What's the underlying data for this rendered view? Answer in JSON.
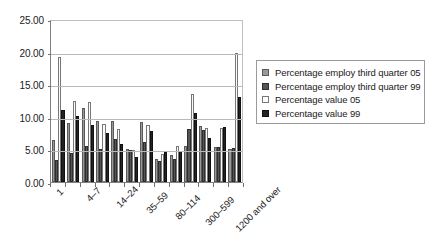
{
  "chart_data": {
    "type": "bar",
    "title": "",
    "xlabel": "",
    "ylabel": "",
    "ylim": [
      0,
      25
    ],
    "ytick_labels": [
      "0.00",
      "5.00",
      "10.00",
      "15.00",
      "20.00",
      "25.00"
    ],
    "ytick_values": [
      0,
      5,
      10,
      15,
      20,
      25
    ],
    "grid": true,
    "legend_position": "right",
    "categories": [
      "1",
      "2-3",
      "4-7",
      "8-13",
      "14-24",
      "25-34",
      "35-59",
      "60-79",
      "80-114",
      "115-299",
      "300-599",
      "600-1199",
      "1200 and over"
    ],
    "visible_tick_labels": [
      {
        "index": 0,
        "text": "1"
      },
      {
        "index": 2,
        "text": "4–7"
      },
      {
        "index": 4,
        "text": "14–24"
      },
      {
        "index": 6,
        "text": "35–59"
      },
      {
        "index": 8,
        "text": "80–114"
      },
      {
        "index": 10,
        "text": "300–599"
      },
      {
        "index": 12,
        "text": "1200 and over"
      }
    ],
    "series": [
      {
        "name": "Percentage employ third quarter 05",
        "color": "#999999",
        "values": [
          6.5,
          9.1,
          11.3,
          9.3,
          9.3,
          5.0,
          9.2,
          3.5,
          4.2,
          5.6,
          8.6,
          5.4,
          5.1
        ]
      },
      {
        "name": "Percentage employ third quarter 99",
        "color": "#555555",
        "values": [
          3.3,
          4.4,
          5.6,
          5.0,
          6.6,
          4.9,
          6.1,
          3.2,
          3.5,
          8.1,
          8.0,
          5.4,
          5.2
        ]
      },
      {
        "name": "Percentage value 05",
        "color": "#fdfdfd",
        "values": [
          19.1,
          12.5,
          12.3,
          8.9,
          8.1,
          4.9,
          8.8,
          4.3,
          5.6,
          13.5,
          8.3,
          8.3,
          19.8
        ]
      },
      {
        "name": "Percentage value 99",
        "color": "#232323",
        "values": [
          11.1,
          10.2,
          8.7,
          7.5,
          5.9,
          3.8,
          7.9,
          4.6,
          4.8,
          10.6,
          6.7,
          8.4,
          13.1
        ]
      }
    ]
  },
  "legend": {
    "items": [
      {
        "label": "Percentage employ third quarter 05",
        "swatch": "legend-swatch-series-0"
      },
      {
        "label": "Percentage employ third quarter 99",
        "swatch": "legend-swatch-series-1"
      },
      {
        "label": "Percentage value 05",
        "swatch": "legend-swatch-series-2"
      },
      {
        "label": "Percentage value 99",
        "swatch": "legend-swatch-series-3"
      }
    ]
  }
}
